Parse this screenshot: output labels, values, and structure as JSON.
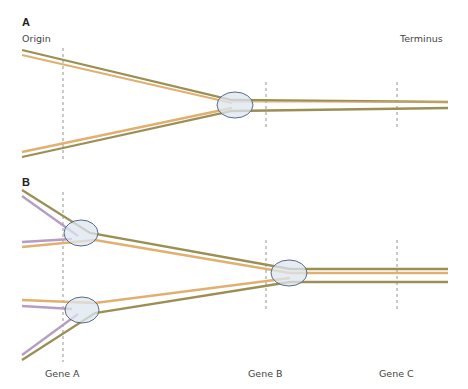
{
  "panels": {
    "a": {
      "label": "A",
      "origin_label": "Origin",
      "terminus_label": "Terminus"
    },
    "b": {
      "label": "B"
    }
  },
  "genes": [
    {
      "label": "Gene A"
    },
    {
      "label": "Gene B"
    },
    {
      "label": "Gene C"
    }
  ],
  "colors": {
    "parental_strand": "#9b8f55",
    "other_strand": "#e0b070",
    "new_strand": "#b79cc4",
    "replication_fork_fill": "#dde5ef",
    "replication_fork_stroke": "#4a5a7a",
    "guide_line": "#7a7a7a"
  }
}
